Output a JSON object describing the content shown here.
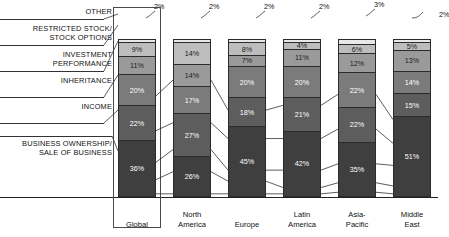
{
  "chart_data": {
    "type": "bar",
    "title": "",
    "subtitle": "",
    "xlabel": "",
    "ylabel": "",
    "ylim": [
      0,
      100
    ],
    "stacked": true,
    "normalized_percent": true,
    "grid": false,
    "legend_position": "left-labels-with-leader-lines",
    "categories": [
      "Global",
      "North America",
      "Europe",
      "Latin America",
      "Asia-Pacific",
      "Middle East"
    ],
    "series": [
      {
        "name": "OTHER",
        "values": [
          2,
          2,
          2,
          2,
          3,
          2
        ],
        "color": "#e8e8e8",
        "label_outside": true
      },
      {
        "name": "RESTRICTED STOCK/ STOCK OPTIONS",
        "values": [
          9,
          14,
          8,
          4,
          6,
          5
        ],
        "color": "#bdbdbd"
      },
      {
        "name": "INVESTMENT PERFORMANCE",
        "values": [
          11,
          14,
          7,
          11,
          12,
          13
        ],
        "color": "#9a9a9a"
      },
      {
        "name": "INHERITANCE",
        "values": [
          20,
          17,
          20,
          20,
          22,
          14
        ],
        "color": "#7b7b7b"
      },
      {
        "name": "INCOME",
        "values": [
          22,
          27,
          18,
          21,
          22,
          15
        ],
        "color": "#5d5d5d"
      },
      {
        "name": "BUSINESS OWNERSHIP/ SALE OF BUSINESS",
        "values": [
          36,
          26,
          45,
          42,
          35,
          51
        ],
        "color": "#3f3f3f"
      }
    ],
    "value_labels": {
      "Global": [
        "2%",
        "9%",
        "11%",
        "20%",
        "22%",
        "36%"
      ],
      "North America": [
        "2%",
        "14%",
        "14%",
        "17%",
        "27%",
        "26%"
      ],
      "Europe": [
        "2%",
        "8%",
        "7%",
        "20%",
        "18%",
        "45%"
      ],
      "Latin America": [
        "2%",
        "4%",
        "11%",
        "20%",
        "21%",
        "42%"
      ],
      "Asia-Pacific": [
        "3%",
        "6%",
        "12%",
        "22%",
        "22%",
        "35%"
      ],
      "Middle East": [
        "2%",
        "5%",
        "13%",
        "14%",
        "15%",
        "51%"
      ]
    }
  },
  "left_labels": [
    {
      "text": "OTHER"
    },
    {
      "text": "RESTRICTED STOCK/\nSTOCK OPTIONS"
    },
    {
      "text": "INVESTMENT\nPERFORMANCE"
    },
    {
      "text": "INHERITANCE"
    },
    {
      "text": "INCOME"
    },
    {
      "text": "BUSINESS OWNERSHIP/\nSALE OF BUSINESS"
    }
  ],
  "x_tick_labels": [
    "Global",
    "North\nAmerica",
    "Europe",
    "Latin\nAmerica",
    "Asia-\nPacific",
    "Middle\nEast"
  ],
  "other_callouts": [
    "2%",
    "2%",
    "2%",
    "2%",
    "3%",
    "2%"
  ],
  "highlight": {
    "category": "Global"
  },
  "colors": {
    "other": "#e8e8e8",
    "restricted_stock": "#bdbdbd",
    "investment_performance": "#9a9a9a",
    "inheritance": "#7b7b7b",
    "income": "#5d5d5d",
    "business_ownership": "#3f3f3f",
    "stroke": "#2b2b2b",
    "axis": "#222222",
    "background": "#ffffff"
  }
}
